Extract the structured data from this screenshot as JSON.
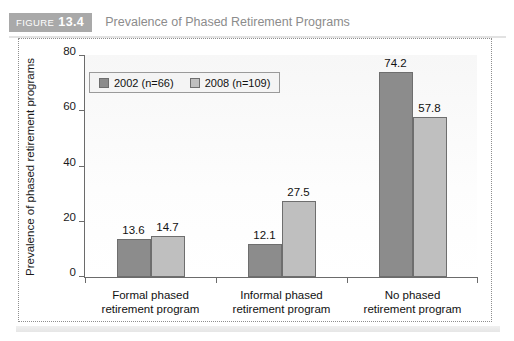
{
  "figure": {
    "badge_word": "FIGURE",
    "badge_number": "13.4",
    "title": "Prevalence of Phased Retirement Programs"
  },
  "chart_data": {
    "type": "bar",
    "title": "Prevalence of Phased Retirement Programs",
    "xlabel": "",
    "ylabel": "Prevalence of phased retirement programs",
    "ylim": [
      0,
      80
    ],
    "yticks": [
      0,
      20,
      40,
      60,
      80
    ],
    "ytick_labels": [
      "0",
      "20",
      "40",
      "60",
      "80"
    ],
    "grid": false,
    "legend_position": "upper-left-inside",
    "categories": [
      "Formal phased\nretirement program",
      "Informal phased\nretirement program",
      "No phased\nretirement program"
    ],
    "category_lines": [
      [
        "Formal phased",
        "retirement program"
      ],
      [
        "Informal phased",
        "retirement program"
      ],
      [
        "No phased",
        "retirement program"
      ]
    ],
    "series": [
      {
        "name": "2002 (n=66)",
        "color": "#8c8c8c",
        "values": [
          13.6,
          12.1,
          74.2
        ],
        "labels": [
          "13.6",
          "12.1",
          "74.2"
        ]
      },
      {
        "name": "2008 (n=109)",
        "color": "#bfbfbf",
        "values": [
          14.7,
          27.5,
          57.8
        ],
        "labels": [
          "14.7",
          "27.5",
          "57.8"
        ]
      }
    ]
  },
  "colors": {
    "series_2002": "#8c8c8c",
    "series_2008": "#bfbfbf",
    "badge_background": "#a9a9a9",
    "title_text": "#8c8c8c",
    "axis": "#6b6b6b"
  }
}
